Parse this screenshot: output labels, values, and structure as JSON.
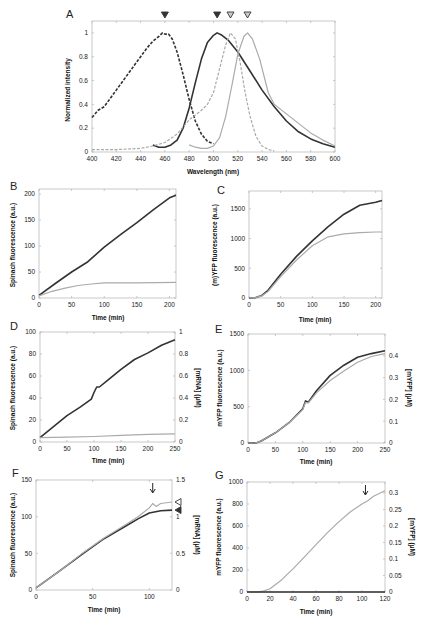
{
  "chart_data": [
    {
      "panel": "A",
      "type": "line",
      "title": "",
      "xlabel": "Wavelength (nm)",
      "ylabel": "Normalized intensity",
      "xlim": [
        400,
        600
      ],
      "ylim": [
        0,
        1.1
      ],
      "xticks": [
        400,
        420,
        440,
        460,
        480,
        500,
        520,
        540,
        560,
        580,
        600
      ],
      "yticks": [
        0,
        0.2,
        0.4,
        0.6,
        0.8,
        1
      ],
      "grid": false,
      "markers": [
        {
          "x": 460,
          "style": "filled-triangle"
        },
        {
          "x": 503,
          "style": "filled-triangle"
        },
        {
          "x": 514,
          "style": "open-triangle"
        },
        {
          "x": 528,
          "style": "open-triangle"
        }
      ],
      "series": [
        {
          "name": "Spinach excitation",
          "style": "dark dashed",
          "color": "#333333",
          "x": [
            400,
            405,
            410,
            420,
            430,
            440,
            445,
            450,
            455,
            458,
            460,
            463,
            466,
            470,
            475,
            480,
            485,
            490,
            495,
            500
          ],
          "y": [
            0.29,
            0.35,
            0.38,
            0.52,
            0.66,
            0.8,
            0.87,
            0.93,
            0.97,
            1.0,
            0.99,
            0.99,
            0.95,
            0.84,
            0.65,
            0.44,
            0.26,
            0.15,
            0.09,
            0.07
          ]
        },
        {
          "name": "Spinach emission",
          "style": "dark solid",
          "color": "#333333",
          "x": [
            450,
            455,
            460,
            465,
            470,
            475,
            480,
            485,
            490,
            495,
            500,
            503,
            507,
            512,
            520,
            530,
            540,
            550,
            560,
            570,
            580,
            590,
            600
          ],
          "y": [
            0.06,
            0.04,
            0.04,
            0.06,
            0.1,
            0.2,
            0.37,
            0.58,
            0.78,
            0.92,
            0.98,
            1.0,
            0.98,
            0.94,
            0.84,
            0.68,
            0.52,
            0.38,
            0.26,
            0.17,
            0.11,
            0.07,
            0.04
          ]
        },
        {
          "name": "mYFP excitation",
          "style": "light dashed",
          "color": "#aaaaaa",
          "x": [
            400,
            420,
            440,
            450,
            460,
            470,
            480,
            490,
            495,
            500,
            505,
            510,
            514,
            518,
            522,
            526,
            530,
            535,
            540,
            545,
            550
          ],
          "y": [
            0.02,
            0.02,
            0.03,
            0.05,
            0.08,
            0.15,
            0.27,
            0.35,
            0.4,
            0.5,
            0.7,
            0.9,
            1.0,
            0.95,
            0.75,
            0.5,
            0.3,
            0.13,
            0.05,
            0.02,
            0.01
          ]
        },
        {
          "name": "mYFP emission",
          "style": "light solid",
          "color": "#aaaaaa",
          "x": [
            480,
            485,
            490,
            495,
            500,
            505,
            510,
            515,
            520,
            525,
            528,
            532,
            538,
            545,
            550,
            560,
            570,
            580,
            590,
            600
          ],
          "y": [
            0.06,
            0.04,
            0.03,
            0.03,
            0.05,
            0.12,
            0.3,
            0.55,
            0.82,
            0.97,
            1.0,
            0.95,
            0.78,
            0.5,
            0.4,
            0.32,
            0.24,
            0.16,
            0.1,
            0.05
          ]
        }
      ]
    },
    {
      "panel": "B",
      "type": "line",
      "xlabel": "Time (min)",
      "ylabel": "Spinach fluorescence (a.u.)",
      "xlim": [
        0,
        210
      ],
      "ylim": [
        0,
        210
      ],
      "xticks": [
        0,
        50,
        100,
        150,
        200
      ],
      "yticks": [
        0,
        50,
        100,
        150,
        200
      ],
      "series": [
        {
          "name": "dark",
          "color": "#333333",
          "x": [
            0,
            25,
            50,
            75,
            100,
            125,
            150,
            175,
            200,
            210
          ],
          "y": [
            5,
            28,
            50,
            70,
            98,
            122,
            145,
            170,
            193,
            198
          ]
        },
        {
          "name": "light",
          "color": "#aaaaaa",
          "x": [
            0,
            20,
            40,
            60,
            80,
            100,
            150,
            210
          ],
          "y": [
            4,
            13,
            19,
            24,
            27,
            29,
            29,
            30
          ]
        }
      ]
    },
    {
      "panel": "C",
      "type": "line",
      "xlabel": "Time (min)",
      "ylabel": "(m)YFP fluorescence (a.u.)",
      "xlim": [
        0,
        210
      ],
      "ylim": [
        0,
        1800
      ],
      "xticks": [
        0,
        50,
        100,
        150,
        200
      ],
      "yticks": [
        0,
        500,
        1000,
        1500
      ],
      "series": [
        {
          "name": "dark",
          "color": "#333333",
          "x": [
            0,
            10,
            20,
            30,
            50,
            75,
            100,
            125,
            150,
            175,
            200,
            210
          ],
          "y": [
            0,
            5,
            40,
            130,
            400,
            700,
            960,
            1200,
            1410,
            1560,
            1610,
            1640
          ]
        },
        {
          "name": "light",
          "color": "#aaaaaa",
          "x": [
            0,
            10,
            20,
            30,
            50,
            75,
            100,
            125,
            150,
            175,
            200,
            210
          ],
          "y": [
            0,
            5,
            35,
            110,
            360,
            640,
            880,
            1030,
            1080,
            1100,
            1110,
            1110
          ]
        }
      ]
    },
    {
      "panel": "D",
      "type": "line",
      "xlabel": "Time (min)",
      "ylabel": "Spinach fluorescence (a.u.)",
      "ylabel_right": "[mRNA] (µM)",
      "xlim": [
        0,
        250
      ],
      "ylim": [
        0,
        100
      ],
      "ylim_right": [
        0,
        1
      ],
      "xticks": [
        0,
        50,
        100,
        150,
        200,
        250
      ],
      "yticks": [
        0,
        20,
        40,
        60,
        80,
        100
      ],
      "yticks_right": [
        0,
        0.2,
        0.4,
        0.6,
        0.8,
        1
      ],
      "series": [
        {
          "name": "dark",
          "color": "#333333",
          "x": [
            0,
            25,
            50,
            75,
            95,
            100,
            105,
            110,
            125,
            150,
            175,
            200,
            225,
            250
          ],
          "y": [
            4,
            14,
            24,
            32,
            39,
            45,
            50,
            50,
            56,
            66,
            75,
            81,
            88,
            93
          ]
        },
        {
          "name": "light",
          "color": "#aaaaaa",
          "x": [
            0,
            50,
            100,
            150,
            200,
            250
          ],
          "y": [
            4,
            4.5,
            5,
            6,
            7,
            7.5
          ]
        }
      ]
    },
    {
      "panel": "E",
      "type": "line",
      "xlabel": "Time (min)",
      "ylabel": "mYFP fluorescence (a.u.)",
      "ylabel_right": "[mYFP] (µM)",
      "xlim": [
        0,
        250
      ],
      "ylim": [
        0,
        1500
      ],
      "ylim_right": [
        0,
        0.5
      ],
      "xticks": [
        0,
        50,
        100,
        150,
        200,
        250
      ],
      "yticks": [
        0,
        500,
        1000,
        1500
      ],
      "yticks_right": [
        0,
        0.1,
        0.2,
        0.3,
        0.4
      ],
      "series": [
        {
          "name": "dark",
          "color": "#333333",
          "x": [
            0,
            15,
            25,
            50,
            75,
            100,
            105,
            110,
            125,
            150,
            175,
            200,
            225,
            250
          ],
          "y": [
            0,
            2,
            30,
            140,
            280,
            470,
            580,
            560,
            720,
            930,
            1070,
            1180,
            1230,
            1270
          ]
        },
        {
          "name": "light",
          "color": "#aaaaaa",
          "x": [
            0,
            15,
            25,
            50,
            75,
            100,
            105,
            110,
            125,
            150,
            175,
            200,
            225,
            250
          ],
          "y": [
            0,
            2,
            30,
            140,
            280,
            460,
            560,
            550,
            690,
            860,
            990,
            1110,
            1190,
            1230
          ]
        }
      ]
    },
    {
      "panel": "F",
      "type": "line",
      "xlabel": "Time (min)",
      "ylabel": "Spinach fluorescence (a.u.)",
      "ylabel_right": "[mRNA] (µM)",
      "xlim": [
        0,
        120
      ],
      "ylim": [
        0,
        150
      ],
      "ylim_right": [
        0,
        1.5
      ],
      "xticks": [
        0,
        50,
        100
      ],
      "yticks": [
        0,
        50,
        100,
        150
      ],
      "yticks_right": [
        0,
        0.5,
        1,
        1.5
      ],
      "annotations": [
        {
          "type": "arrow-down",
          "x": 103
        },
        {
          "type": "open-triangle-left",
          "y": 120
        },
        {
          "type": "filled-triangle-left",
          "y": 109
        }
      ],
      "series": [
        {
          "name": "dark",
          "color": "#333333",
          "x": [
            0,
            20,
            40,
            60,
            80,
            90,
            100,
            110,
            120
          ],
          "y": [
            3,
            25,
            48,
            70,
            88,
            97,
            105,
            108,
            109
          ]
        },
        {
          "name": "light",
          "color": "#aaaaaa",
          "x": [
            0,
            20,
            40,
            60,
            80,
            90,
            100,
            103,
            106,
            110,
            120
          ],
          "y": [
            3,
            25,
            49,
            71,
            90,
            100,
            112,
            118,
            114,
            118,
            120
          ]
        }
      ]
    },
    {
      "panel": "G",
      "type": "line",
      "xlabel": "Time (min)",
      "ylabel": "mYFP fluorescence (a.u.)",
      "ylabel_right": "[mYFP] (µM)",
      "xlim": [
        0,
        120
      ],
      "ylim": [
        0,
        1000
      ],
      "ylim_right": [
        0,
        0.333
      ],
      "xticks": [
        0,
        20,
        40,
        60,
        80,
        100,
        120
      ],
      "yticks": [
        0,
        200,
        400,
        600,
        800,
        1000
      ],
      "yticks_right": [
        0,
        0.05,
        0.1,
        0.15,
        0.2,
        0.25,
        0.3
      ],
      "annotations": [
        {
          "type": "arrow-down",
          "x": 103
        }
      ],
      "series": [
        {
          "name": "light",
          "color": "#aaaaaa",
          "x": [
            0,
            10,
            15,
            20,
            30,
            40,
            50,
            60,
            70,
            80,
            90,
            100,
            105,
            110,
            120
          ],
          "y": [
            0,
            2,
            10,
            30,
            110,
            210,
            320,
            430,
            540,
            640,
            730,
            800,
            830,
            870,
            920
          ]
        },
        {
          "name": "dark",
          "color": "#333333",
          "x": [
            0,
            120
          ],
          "y": [
            0,
            0
          ]
        }
      ]
    }
  ],
  "panels": {
    "A": {
      "label": "A",
      "xlabel": "Wavelength (nm)",
      "ylabel": "Normalized intensity"
    },
    "B": {
      "label": "B",
      "xlabel": "Time (min)",
      "ylabel": "Spinach fluorescence (a.u.)"
    },
    "C": {
      "label": "C",
      "xlabel": "Time (min)",
      "ylabel": "(m)YFP fluorescence (a.u.)"
    },
    "D": {
      "label": "D",
      "xlabel": "Time (min)",
      "ylabel": "Spinach fluorescence (a.u.)",
      "ylabel_right": "[mRNA] (µM)"
    },
    "E": {
      "label": "E",
      "xlabel": "Time (min)",
      "ylabel": "mYFP fluorescence (a.u.)",
      "ylabel_right": "[mYFP] (µM)"
    },
    "F": {
      "label": "F",
      "xlabel": "Time (min)",
      "ylabel": "Spinach fluorescence (a.u.)",
      "ylabel_right": "[mRNA] (µM)"
    },
    "G": {
      "label": "G",
      "xlabel": "Time (min)",
      "ylabel": "mYFP fluorescence (a.u.)",
      "ylabel_right": "[mYFP] (µM)"
    }
  },
  "colors": {
    "dark": "#333333",
    "light": "#aaaaaa",
    "axis": "#bbbbbb",
    "text": "#222222"
  }
}
